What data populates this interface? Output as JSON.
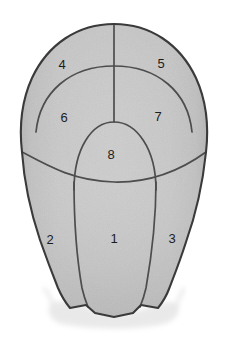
{
  "figure": {
    "kind": "anatomical-schematic",
    "width": 228,
    "height": 338,
    "background_color": "#ffffff",
    "fill_color": "#c6c6c6",
    "fill_color_light": "#d6d6d6",
    "fill_color_dark": "#aaaaaa",
    "line_color": "#4a4a4a",
    "outline_color": "#3d3d3d",
    "label_color": "#1c1c1c",
    "label_font_size": 13
  },
  "regions": [
    {
      "id": "region-1",
      "label": "1",
      "x": 114,
      "y": 240,
      "position": "lower-median"
    },
    {
      "id": "region-2",
      "label": "2",
      "x": 50,
      "y": 241,
      "position": "lower-left"
    },
    {
      "id": "region-3",
      "label": "3",
      "x": 172,
      "y": 240,
      "position": "lower-right"
    },
    {
      "id": "region-4",
      "label": "4",
      "x": 62,
      "y": 66,
      "position": "upper-left"
    },
    {
      "id": "region-5",
      "label": "5",
      "x": 161,
      "y": 65,
      "position": "upper-right"
    },
    {
      "id": "region-6",
      "label": "6",
      "x": 64,
      "y": 119,
      "position": "mid-left"
    },
    {
      "id": "region-7",
      "label": "7",
      "x": 158,
      "y": 118,
      "position": "mid-right"
    },
    {
      "id": "region-8",
      "label": "8",
      "x": 111,
      "y": 156,
      "position": "central-dome"
    }
  ]
}
